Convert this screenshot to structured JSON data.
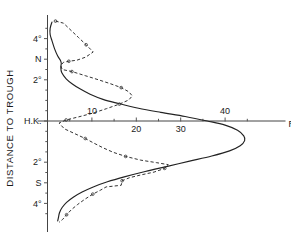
{
  "chart_data": {
    "type": "line",
    "title": "",
    "subtitle": "",
    "xlabel": "Rainfall  mm",
    "ylabel": "DISTANCE TO TROUGH",
    "xlim": [
      0,
      50
    ],
    "ylim": [
      -5,
      5
    ],
    "grid": false,
    "legend_position": "none",
    "x_ticks": [
      {
        "value": 10,
        "label": "10",
        "label_side": "above"
      },
      {
        "value": 20,
        "label": "20",
        "label_side": "below"
      },
      {
        "value": 30,
        "label": "30",
        "label_side": "below"
      },
      {
        "value": 40,
        "label": "40",
        "label_side": "above"
      }
    ],
    "x_minor_ticks": [
      5,
      15,
      25,
      35,
      45
    ],
    "y_ticks": [
      {
        "value": 4,
        "label": "4°"
      },
      {
        "value": 3,
        "label": "N"
      },
      {
        "value": 2,
        "label": "2°"
      },
      {
        "value": 0,
        "label": "H.K."
      },
      {
        "value": -2,
        "label": "2°"
      },
      {
        "value": -3,
        "label": "S"
      },
      {
        "value": -4,
        "label": "4°"
      }
    ],
    "y_minor_ticks": [
      4.5,
      3.5,
      2.5,
      1.5,
      1,
      0.5,
      -0.5,
      -1,
      -1.5,
      -2.5,
      -3.5,
      -4.5
    ],
    "series": [
      {
        "name": "solid-curve",
        "style": "solid",
        "markers": false,
        "points": [
          [
            1.0,
            4.8
          ],
          [
            0.6,
            4.5
          ],
          [
            0.6,
            4.2
          ],
          [
            1.0,
            3.9
          ],
          [
            1.6,
            3.5
          ],
          [
            2.3,
            3.15
          ],
          [
            2.9,
            2.95
          ],
          [
            3.1,
            2.8
          ],
          [
            3.0,
            2.6
          ],
          [
            3.2,
            2.35
          ],
          [
            4.2,
            2.05
          ],
          [
            5.6,
            1.8
          ],
          [
            7.4,
            1.55
          ],
          [
            9.6,
            1.3
          ],
          [
            12.5,
            1.05
          ],
          [
            16.0,
            0.85
          ],
          [
            20.5,
            0.62
          ],
          [
            25.5,
            0.42
          ],
          [
            31.0,
            0.22
          ],
          [
            36.0,
            0.0
          ],
          [
            40.0,
            -0.2
          ],
          [
            42.8,
            -0.45
          ],
          [
            44.2,
            -0.72
          ],
          [
            44.4,
            -0.95
          ],
          [
            43.4,
            -1.2
          ],
          [
            41.0,
            -1.45
          ],
          [
            37.0,
            -1.7
          ],
          [
            32.0,
            -1.95
          ],
          [
            27.0,
            -2.2
          ],
          [
            22.0,
            -2.45
          ],
          [
            17.5,
            -2.7
          ],
          [
            13.5,
            -2.95
          ],
          [
            10.3,
            -3.2
          ],
          [
            7.8,
            -3.45
          ],
          [
            5.8,
            -3.7
          ],
          [
            4.3,
            -3.95
          ],
          [
            3.3,
            -4.2
          ],
          [
            2.7,
            -4.45
          ],
          [
            2.5,
            -4.65
          ],
          [
            2.3,
            -4.85
          ]
        ]
      },
      {
        "name": "dashed-curve",
        "style": "dashed",
        "markers": true,
        "points": [
          [
            1.8,
            4.85
          ],
          [
            3.6,
            4.75
          ],
          [
            5.3,
            4.4
          ],
          [
            7.0,
            4.05
          ],
          [
            8.7,
            3.7
          ],
          [
            10.3,
            3.35
          ],
          [
            8.6,
            3.1
          ],
          [
            6.6,
            2.95
          ],
          [
            4.8,
            2.9
          ],
          [
            3.6,
            2.85
          ],
          [
            3.0,
            2.7
          ],
          [
            3.3,
            2.5
          ],
          [
            5.5,
            2.4
          ],
          [
            8.5,
            2.2
          ],
          [
            11.5,
            2.0
          ],
          [
            14.3,
            1.8
          ],
          [
            16.6,
            1.62
          ],
          [
            18.3,
            1.42
          ],
          [
            19.1,
            1.22
          ],
          [
            18.3,
            1.02
          ],
          [
            16.2,
            0.82
          ],
          [
            13.3,
            0.6
          ],
          [
            10.2,
            0.38
          ],
          [
            7.0,
            0.2
          ],
          [
            4.2,
            0.05
          ],
          [
            2.6,
            -0.1
          ],
          [
            3.8,
            -0.38
          ],
          [
            6.2,
            -0.62
          ],
          [
            8.5,
            -0.85
          ],
          [
            10.5,
            -1.08
          ],
          [
            12.5,
            -1.3
          ],
          [
            14.8,
            -1.52
          ],
          [
            17.6,
            -1.72
          ],
          [
            21.0,
            -1.9
          ],
          [
            24.5,
            -2.02
          ],
          [
            27.2,
            -2.12
          ],
          [
            26.4,
            -2.3
          ],
          [
            24.0,
            -2.48
          ],
          [
            21.0,
            -2.62
          ],
          [
            18.5,
            -2.75
          ],
          [
            16.8,
            -2.9
          ],
          [
            16.6,
            -3.12
          ],
          [
            13.2,
            -3.2
          ],
          [
            12.0,
            -3.35
          ],
          [
            10.2,
            -3.55
          ],
          [
            8.4,
            -3.8
          ],
          [
            6.8,
            -4.05
          ],
          [
            5.4,
            -4.3
          ],
          [
            4.3,
            -4.55
          ],
          [
            3.4,
            -4.78
          ],
          [
            2.6,
            -4.92
          ]
        ]
      }
    ]
  }
}
